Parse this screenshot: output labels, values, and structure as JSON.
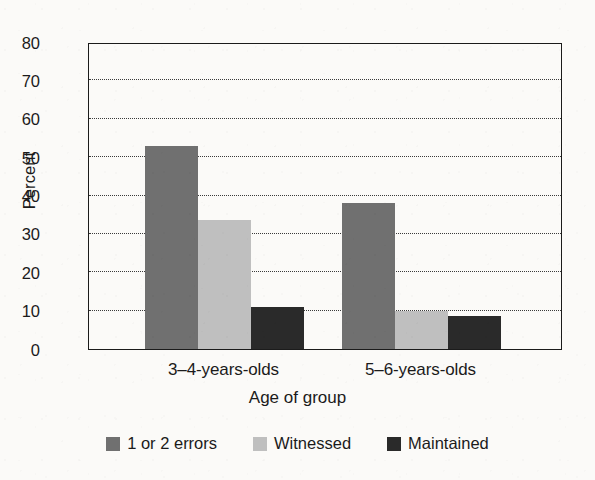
{
  "chart_data": {
    "type": "bar",
    "title": "",
    "subtitle": "",
    "xlabel": "Age of group",
    "ylabel": "Percent",
    "categories": [
      "3–4-years-olds",
      "5–6-years-olds"
    ],
    "series": [
      {
        "name": "1 or 2 errors",
        "values": [
          53,
          38
        ],
        "color": "#707070"
      },
      {
        "name": "Witnessed",
        "values": [
          33.5,
          9.8
        ],
        "color": "#bfbfbf"
      },
      {
        "name": "Maintained",
        "values": [
          11,
          8.5
        ],
        "color": "#2a2a2a"
      }
    ],
    "ylim": [
      0,
      80
    ],
    "yticks": [
      0,
      10,
      20,
      30,
      40,
      50,
      60,
      70,
      80
    ],
    "ytick_labels": [
      "0",
      "10",
      "20",
      "30",
      "40",
      "50",
      "60",
      "70",
      "80"
    ],
    "grid": "horizontal-dotted",
    "grid_color": "#3a3a3a",
    "legend_position": "bottom-center",
    "axis_color": "#1b1b1b",
    "background_color": "#fbfaf8",
    "bar_group_gap": true,
    "bars_touch_within_group": true
  },
  "legend": {
    "items": [
      {
        "label": "1 or 2 errors",
        "color": "#707070"
      },
      {
        "label": "Witnessed",
        "color": "#bfbfbf"
      },
      {
        "label": "Maintained",
        "color": "#2a2a2a"
      }
    ]
  }
}
